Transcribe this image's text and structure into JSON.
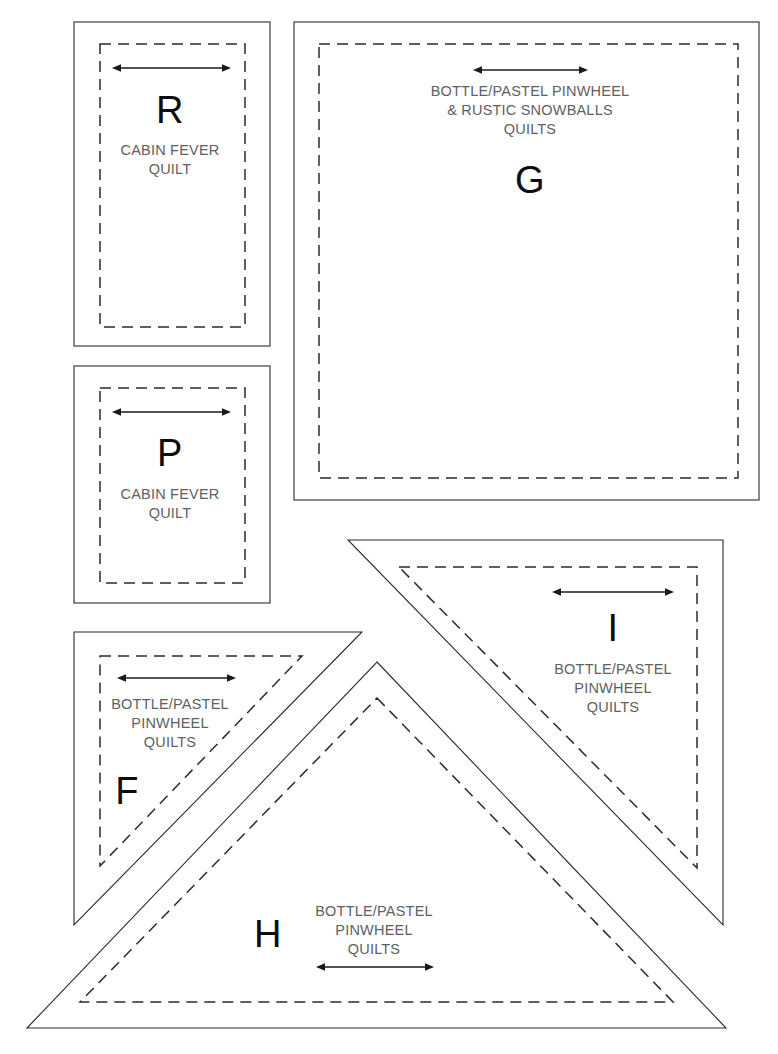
{
  "page": {
    "kind": "quilt-template-sheet",
    "background_color": "#ffffff",
    "line_color": "#2b2b2b",
    "text_color": "#5f6163",
    "letter_color": "#0d0d0d",
    "width": 778,
    "height": 1054
  },
  "templates": [
    {
      "id": "R",
      "letter": "R",
      "shape": "rectangle",
      "text": "CABIN FEVER\nQUILT",
      "grain_arrow": "double-headed-horizontal"
    },
    {
      "id": "G",
      "letter": "G",
      "shape": "square",
      "text": "BOTTLE/PASTEL PINWHEEL\n& RUSTIC SNOWBALLS\nQUILTS",
      "grain_arrow": "double-headed-horizontal"
    },
    {
      "id": "P",
      "letter": "P",
      "shape": "rectangle",
      "text": "CABIN FEVER\nQUILT",
      "grain_arrow": "double-headed-horizontal"
    },
    {
      "id": "I",
      "letter": "I",
      "shape": "right-triangle",
      "text": "BOTTLE/PASTEL\nPINWHEEL\nQUILTS",
      "grain_arrow": "double-headed-horizontal"
    },
    {
      "id": "F",
      "letter": "F",
      "shape": "right-triangle",
      "text": "BOTTLE/PASTEL\nPINWHEEL\nQUILTS",
      "grain_arrow": "double-headed-horizontal"
    },
    {
      "id": "H",
      "letter": "H",
      "shape": "isosceles-triangle",
      "text": "BOTTLE/PASTEL\nPINWHEEL\nQUILTS",
      "grain_arrow": "double-headed-horizontal"
    }
  ]
}
